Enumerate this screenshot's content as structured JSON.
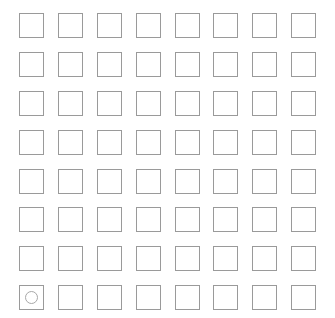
{
  "canvas": {
    "width": 335,
    "height": 318,
    "background_color": "#ffffff"
  },
  "grid": {
    "name": "square-grid",
    "rows": 8,
    "columns": 8,
    "total_cells": 64,
    "cell_size_px": 25,
    "cell_pitch_px": 38.9,
    "origin_x_px": 19,
    "origin_y_px": 13,
    "cell_border_color": "#9a9a9a",
    "cell_fill_color": "#ffffff",
    "marker": {
      "icon": "circle-icon",
      "shape": "ring",
      "stroke_color": "#a8a8a8",
      "diameter_px": 13,
      "row": 8,
      "column": 1
    },
    "cells": [
      {
        "row": 1,
        "column": 1,
        "marker": ""
      },
      {
        "row": 1,
        "column": 2,
        "marker": ""
      },
      {
        "row": 1,
        "column": 3,
        "marker": ""
      },
      {
        "row": 1,
        "column": 4,
        "marker": ""
      },
      {
        "row": 1,
        "column": 5,
        "marker": ""
      },
      {
        "row": 1,
        "column": 6,
        "marker": ""
      },
      {
        "row": 1,
        "column": 7,
        "marker": ""
      },
      {
        "row": 1,
        "column": 8,
        "marker": ""
      },
      {
        "row": 2,
        "column": 1,
        "marker": ""
      },
      {
        "row": 2,
        "column": 2,
        "marker": ""
      },
      {
        "row": 2,
        "column": 3,
        "marker": ""
      },
      {
        "row": 2,
        "column": 4,
        "marker": ""
      },
      {
        "row": 2,
        "column": 5,
        "marker": ""
      },
      {
        "row": 2,
        "column": 6,
        "marker": ""
      },
      {
        "row": 2,
        "column": 7,
        "marker": ""
      },
      {
        "row": 2,
        "column": 8,
        "marker": ""
      },
      {
        "row": 3,
        "column": 1,
        "marker": ""
      },
      {
        "row": 3,
        "column": 2,
        "marker": ""
      },
      {
        "row": 3,
        "column": 3,
        "marker": ""
      },
      {
        "row": 3,
        "column": 4,
        "marker": ""
      },
      {
        "row": 3,
        "column": 5,
        "marker": ""
      },
      {
        "row": 3,
        "column": 6,
        "marker": ""
      },
      {
        "row": 3,
        "column": 7,
        "marker": ""
      },
      {
        "row": 3,
        "column": 8,
        "marker": ""
      },
      {
        "row": 4,
        "column": 1,
        "marker": ""
      },
      {
        "row": 4,
        "column": 2,
        "marker": ""
      },
      {
        "row": 4,
        "column": 3,
        "marker": ""
      },
      {
        "row": 4,
        "column": 4,
        "marker": ""
      },
      {
        "row": 4,
        "column": 5,
        "marker": ""
      },
      {
        "row": 4,
        "column": 6,
        "marker": ""
      },
      {
        "row": 4,
        "column": 7,
        "marker": ""
      },
      {
        "row": 4,
        "column": 8,
        "marker": ""
      },
      {
        "row": 5,
        "column": 1,
        "marker": ""
      },
      {
        "row": 5,
        "column": 2,
        "marker": ""
      },
      {
        "row": 5,
        "column": 3,
        "marker": ""
      },
      {
        "row": 5,
        "column": 4,
        "marker": ""
      },
      {
        "row": 5,
        "column": 5,
        "marker": ""
      },
      {
        "row": 5,
        "column": 6,
        "marker": ""
      },
      {
        "row": 5,
        "column": 7,
        "marker": ""
      },
      {
        "row": 5,
        "column": 8,
        "marker": ""
      },
      {
        "row": 6,
        "column": 1,
        "marker": ""
      },
      {
        "row": 6,
        "column": 2,
        "marker": ""
      },
      {
        "row": 6,
        "column": 3,
        "marker": ""
      },
      {
        "row": 6,
        "column": 4,
        "marker": ""
      },
      {
        "row": 6,
        "column": 5,
        "marker": ""
      },
      {
        "row": 6,
        "column": 6,
        "marker": ""
      },
      {
        "row": 6,
        "column": 7,
        "marker": ""
      },
      {
        "row": 6,
        "column": 8,
        "marker": ""
      },
      {
        "row": 7,
        "column": 1,
        "marker": ""
      },
      {
        "row": 7,
        "column": 2,
        "marker": ""
      },
      {
        "row": 7,
        "column": 3,
        "marker": ""
      },
      {
        "row": 7,
        "column": 4,
        "marker": ""
      },
      {
        "row": 7,
        "column": 5,
        "marker": ""
      },
      {
        "row": 7,
        "column": 6,
        "marker": ""
      },
      {
        "row": 7,
        "column": 7,
        "marker": ""
      },
      {
        "row": 7,
        "column": 8,
        "marker": ""
      },
      {
        "row": 8,
        "column": 1,
        "marker": "circle-icon"
      },
      {
        "row": 8,
        "column": 2,
        "marker": ""
      },
      {
        "row": 8,
        "column": 3,
        "marker": ""
      },
      {
        "row": 8,
        "column": 4,
        "marker": ""
      },
      {
        "row": 8,
        "column": 5,
        "marker": ""
      },
      {
        "row": 8,
        "column": 6,
        "marker": ""
      },
      {
        "row": 8,
        "column": 7,
        "marker": ""
      },
      {
        "row": 8,
        "column": 8,
        "marker": ""
      }
    ]
  }
}
